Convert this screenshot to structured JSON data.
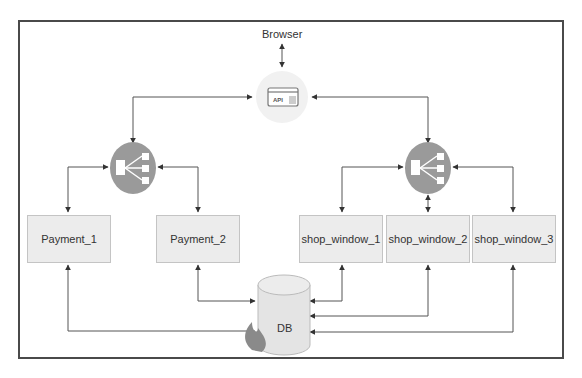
{
  "diagram": {
    "browser": {
      "label": "Browser"
    },
    "api_gateway": {
      "icon_text": "API",
      "name": "api-gateway"
    },
    "load_balancers": [
      {
        "name": "load-balancer-payment"
      },
      {
        "name": "load-balancer-shop"
      }
    ],
    "services": [
      {
        "label": "Payment_1"
      },
      {
        "label": "Payment_2"
      },
      {
        "label": "shop_window_1"
      },
      {
        "label": "shop_window_2"
      },
      {
        "label": "shop_window_3"
      }
    ],
    "database": {
      "label": "DB"
    },
    "colors": {
      "box_fill": "#ececec",
      "box_border": "#c4c4c4",
      "lb_fill": "#9a9a9a",
      "db_fill": "#e4e4e4",
      "flame": "#8a8a8a",
      "line": "#444444"
    }
  }
}
